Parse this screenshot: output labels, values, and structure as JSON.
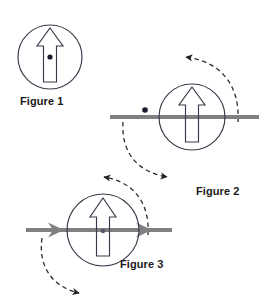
{
  "document": {
    "type": "physics-diagram",
    "title": "Rotating disc with arrow — three figures",
    "background_color": "#ffffff"
  },
  "colors": {
    "outline": "#3a3a4a",
    "axle_gray": "#808080",
    "dashed": "#2b2b2b",
    "dot": "#1a1a2e",
    "label_text": "#1a1a1a"
  },
  "figures": [
    {
      "id": "figure-1",
      "label": "Figure 1",
      "circle": {
        "cx": 50,
        "cy": 57,
        "r": 32
      },
      "arrow": {
        "direction": "up",
        "style": "hollow-outline"
      },
      "center_dot": {
        "cx": 50,
        "cy": 57,
        "r": 2.6
      },
      "has_axle": false,
      "axle_arrowheads": 0,
      "rotation_arcs": 0
    },
    {
      "id": "figure-2",
      "label": "Figure 2",
      "circle": {
        "cx": 192,
        "cy": 117,
        "r": 33
      },
      "arrow": {
        "direction": "up",
        "style": "hollow-outline"
      },
      "offset_dot": {
        "cx": 145,
        "cy": 110,
        "r": 2.8
      },
      "has_axle": true,
      "axle": {
        "x1": 110,
        "x2": 259,
        "y": 117,
        "thickness": 4
      },
      "axle_arrowheads": 0,
      "rotation_arcs": 2,
      "arc_top": {
        "direction": "left",
        "arrowhead": "solid"
      },
      "arc_bottom": {
        "direction": "right",
        "arrowhead": "solid"
      }
    },
    {
      "id": "figure-3",
      "label": "Figure 3",
      "circle": {
        "cx": 103,
        "cy": 230,
        "r": 36
      },
      "arrow": {
        "direction": "up",
        "style": "hollow-outline"
      },
      "center_dot": {
        "cx": 103,
        "cy": 231,
        "r": 2.2
      },
      "has_axle": true,
      "axle": {
        "x1": 26,
        "x2": 172,
        "y": 230,
        "thickness": 4
      },
      "axle_arrowheads": 2,
      "axle_arrowhead_direction": "right",
      "rotation_arcs": 2,
      "arc_top": {
        "direction": "left",
        "arrowhead": "solid"
      },
      "arc_bottom": {
        "direction": "right",
        "arrowhead": "solid"
      }
    }
  ],
  "labels": {
    "figure_1": "Figure 1",
    "figure_2": "Figure 2",
    "figure_3": "Figure 3"
  }
}
